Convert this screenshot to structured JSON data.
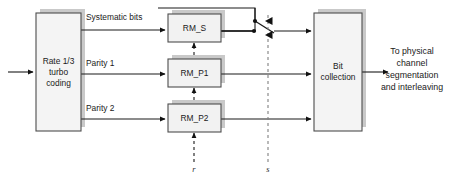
{
  "diagram": {
    "colors": {
      "background": "#ffffff",
      "block_fill": "#f2f2f2",
      "block_fill_light": "#fafafa",
      "block_stroke": "#4d4d4d",
      "shadow_fill": "#c9c9c9",
      "line": "#1a1a1a",
      "dashed_line": "#808080",
      "text": "#1a1a1a"
    },
    "blocks": [
      {
        "id": "turbo-coding",
        "name": "rate-turbo-coding-block",
        "lines": [
          "Rate 1/3",
          "turbo",
          "coding"
        ],
        "x": 36,
        "y": 13,
        "w": 45,
        "h": 118
      },
      {
        "id": "rm-s",
        "name": "rm-s-block",
        "lines": [
          "RM_S"
        ],
        "x": 168,
        "y": 14,
        "w": 53,
        "h": 28
      },
      {
        "id": "rm-p1",
        "name": "rm-p1-block",
        "lines": [
          "RM_P1"
        ],
        "x": 168,
        "y": 59,
        "w": 53,
        "h": 28
      },
      {
        "id": "rm-p2",
        "name": "rm-p2-block",
        "lines": [
          "RM_P2"
        ],
        "x": 168,
        "y": 104,
        "w": 53,
        "h": 28
      },
      {
        "id": "bit-collection",
        "name": "bit-collection-block",
        "lines": [
          "Bit",
          "collection"
        ],
        "x": 314,
        "y": 13,
        "w": 48,
        "h": 118
      }
    ],
    "edge_labels": [
      {
        "id": "systematic-bits",
        "text": "Systematic bits",
        "x": 86,
        "y": 20
      },
      {
        "id": "parity-1",
        "text": "Parity 1",
        "x": 86,
        "y": 66
      },
      {
        "id": "parity-2",
        "text": "Parity 2",
        "x": 86,
        "y": 111
      }
    ],
    "control_labels": [
      {
        "id": "r",
        "text": "r",
        "x": 194,
        "y": 170
      },
      {
        "id": "s",
        "text": "s",
        "x": 268,
        "y": 170
      }
    ],
    "output_label": {
      "id": "output-destination",
      "lines": [
        "To physical",
        "channel",
        "segmentation",
        "and interleaving"
      ],
      "x": 412,
      "y": 52
    }
  }
}
